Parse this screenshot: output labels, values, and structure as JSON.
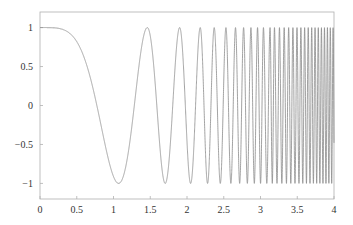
{
  "chart_data": {
    "type": "line",
    "title": "",
    "xlabel": "",
    "ylabel": "",
    "xlim": [
      0,
      4
    ],
    "ylim": [
      -1.2,
      1.2
    ],
    "grid": false,
    "legend": null,
    "x_ticks": [
      "0",
      "0.5",
      "1",
      "1.5",
      "2",
      "2.5",
      "3",
      "3.5",
      "4"
    ],
    "y_ticks": [
      "1",
      "0.5",
      "0",
      "−0.5",
      "−1"
    ],
    "y_tick_values": [
      1,
      0.5,
      0,
      -0.5,
      -1
    ],
    "x_tick_values": [
      0,
      0.5,
      1,
      1.5,
      2,
      2.5,
      3,
      3.5,
      4
    ],
    "series": [
      {
        "name": "chirp cos(phase(x))",
        "description": "Oscillation with amplitude 1 whose frequency increases with x; y=1 at x=0, first minimum near x=1.07",
        "phase_points": {
          "x": [
            0,
            0.5,
            0.75,
            1.07,
            1.46,
            1.9,
            2.18,
            2.37,
            2.53,
            2.66,
            2.77,
            2.87,
            2.96,
            3.04,
            3.13,
            3.19,
            4.0
          ],
          "phase": [
            0,
            0.61,
            1.47,
            3.1416,
            6.2832,
            12.566,
            18.85,
            25.13,
            31.42,
            37.7,
            43.98,
            50.27,
            56.55,
            62.83,
            69.12,
            75.4,
            178
          ]
        },
        "color": "#8a8a8a"
      }
    ],
    "colors": {
      "frame": "#b0b0b0",
      "line": "#8a8a8a",
      "text": "#333333"
    }
  }
}
